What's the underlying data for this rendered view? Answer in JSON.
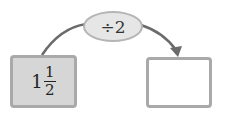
{
  "operation": {
    "label": "÷2"
  },
  "input": {
    "whole": "1",
    "numerator": "1",
    "denominator": "2"
  },
  "output": {
    "value": ""
  },
  "colors": {
    "input_fill": "#d6d6d6",
    "box_border": "#a9a9a9",
    "oval_fill": "#e6e6e6",
    "arrow": "#6b6b6b"
  }
}
